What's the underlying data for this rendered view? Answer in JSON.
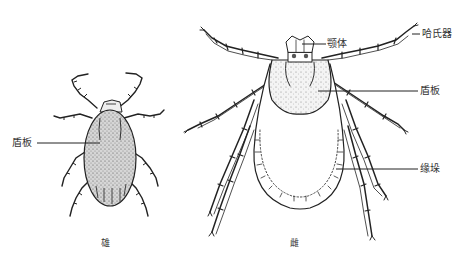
{
  "figure": {
    "male": {
      "caption": "雄",
      "labels": {
        "scutum": "盾板"
      }
    },
    "female": {
      "caption": "雌",
      "labels": {
        "capitulum": "颚体",
        "hallers_organ": "哈氏器",
        "scutum": "盾板",
        "festoon": "缘垛"
      }
    }
  }
}
